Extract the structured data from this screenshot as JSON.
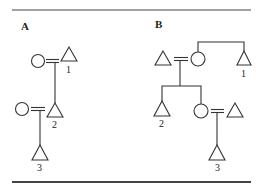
{
  "figure": {
    "panels": [
      {
        "label": "A",
        "individuals": [
          {
            "id": "A-w1",
            "sex": "female",
            "symbol": "circle",
            "number": ""
          },
          {
            "id": "A-1",
            "sex": "male",
            "symbol": "triangle",
            "number": "1"
          },
          {
            "id": "A-w2",
            "sex": "female",
            "symbol": "circle",
            "number": ""
          },
          {
            "id": "A-2",
            "sex": "male",
            "symbol": "triangle",
            "number": "2"
          },
          {
            "id": "A-3",
            "sex": "male",
            "symbol": "triangle",
            "number": "3"
          }
        ],
        "relations": [
          {
            "type": "marriage",
            "a": "A-w1",
            "b": "A-1"
          },
          {
            "type": "descent",
            "parents": [
              "A-w1",
              "A-1"
            ],
            "children": [
              "A-2"
            ]
          },
          {
            "type": "marriage",
            "a": "A-w2",
            "b": "A-2"
          },
          {
            "type": "descent",
            "parents": [
              "A-w2",
              "A-2"
            ],
            "children": [
              "A-3"
            ]
          }
        ]
      },
      {
        "label": "B",
        "individuals": [
          {
            "id": "B-h",
            "sex": "male",
            "symbol": "triangle",
            "number": ""
          },
          {
            "id": "B-w",
            "sex": "female",
            "symbol": "circle",
            "number": ""
          },
          {
            "id": "B-1",
            "sex": "male",
            "symbol": "triangle",
            "number": "1"
          },
          {
            "id": "B-2",
            "sex": "male",
            "symbol": "triangle",
            "number": "2"
          },
          {
            "id": "B-d",
            "sex": "female",
            "symbol": "circle",
            "number": ""
          },
          {
            "id": "B-dh",
            "sex": "male",
            "symbol": "triangle",
            "number": ""
          },
          {
            "id": "B-3",
            "sex": "male",
            "symbol": "triangle",
            "number": "3"
          }
        ],
        "relations": [
          {
            "type": "marriage",
            "a": "B-h",
            "b": "B-w"
          },
          {
            "type": "sibling",
            "a": "B-w",
            "b": "B-1"
          },
          {
            "type": "descent",
            "parents": [
              "B-h",
              "B-w"
            ],
            "children": [
              "B-2",
              "B-d"
            ]
          },
          {
            "type": "marriage",
            "a": "B-d",
            "b": "B-dh"
          },
          {
            "type": "descent",
            "parents": [
              "B-d",
              "B-dh"
            ],
            "children": [
              "B-3"
            ]
          }
        ]
      }
    ],
    "labels": {
      "panel_a": "A",
      "panel_b": "B",
      "a1": "1",
      "a2": "2",
      "a3": "3",
      "b1": "1",
      "b2": "2",
      "b3": "3"
    }
  }
}
